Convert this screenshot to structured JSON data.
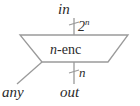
{
  "diagram": {
    "colors": {
      "line": "#9a9a9a",
      "text": "#2b2b2b",
      "background": "#ffffff"
    },
    "block": {
      "name": "n-enc",
      "label_prefix": "n",
      "label_suffix": "-enc",
      "shape": "inverted-trapezoid"
    },
    "ports": {
      "input": {
        "label": "in",
        "width_label": "2",
        "width_exponent": "n",
        "position": "top"
      },
      "output": {
        "label": "out",
        "width_label": "n",
        "position": "bottom"
      },
      "side": {
        "label": "any",
        "position": "bottom-left"
      }
    }
  }
}
